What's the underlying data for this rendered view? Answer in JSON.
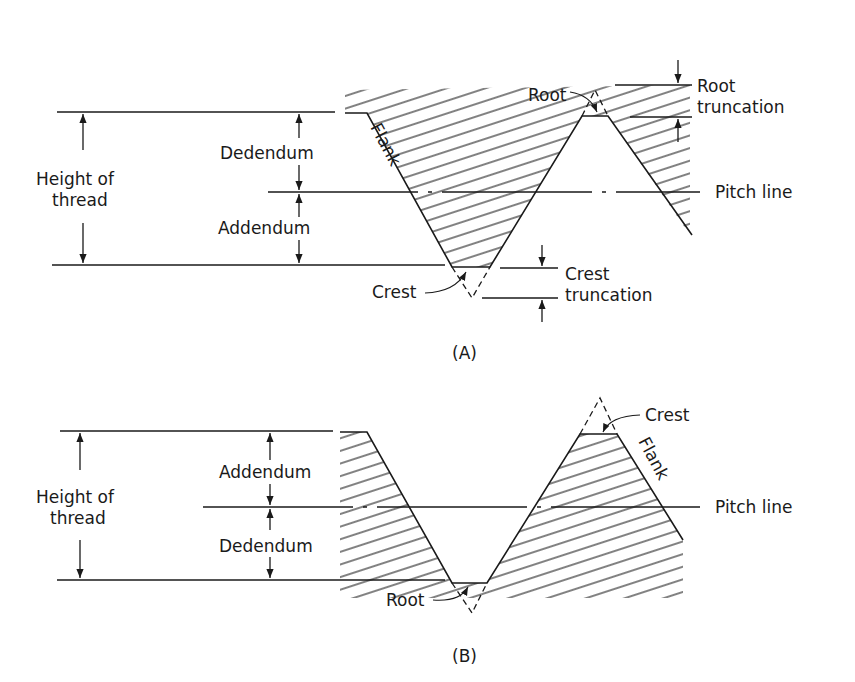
{
  "figure_a": {
    "caption": "(A)",
    "labels": {
      "height_line1": "Height of",
      "height_line2": "thread",
      "dedendum": "Dedendum",
      "addendum": "Addendum",
      "flank": "Flank",
      "root": "Root",
      "root_trunc_line1": "Root",
      "root_trunc_line2": "truncation",
      "pitch_line": "Pitch line",
      "crest": "Crest",
      "crest_trunc_line1": "Crest",
      "crest_trunc_line2": "truncation"
    }
  },
  "figure_b": {
    "caption": "(B)",
    "labels": {
      "height_line1": "Height of",
      "height_line2": "thread",
      "addendum": "Addendum",
      "dedendum": "Dedendum",
      "crest": "Crest",
      "flank": "Flank",
      "pitch_line": "Pitch line",
      "root": "Root"
    }
  },
  "colors": {
    "ink": "#1a1a1a",
    "background": "#ffffff"
  }
}
